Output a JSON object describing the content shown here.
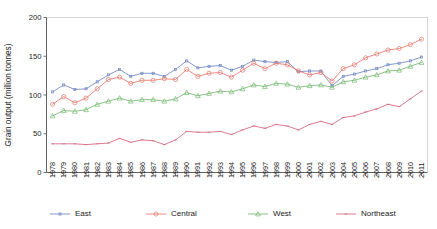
{
  "chart_data": {
    "type": "line",
    "title": "",
    "xlabel": "",
    "ylabel": "Grain output (million tonnes)",
    "ylim": [
      0,
      200
    ],
    "yticks": [
      0,
      50,
      100,
      150,
      200
    ],
    "grid": false,
    "legend_position": "bottom",
    "categories": [
      "1978",
      "1979",
      "1980",
      "1981",
      "1982",
      "1983",
      "1984",
      "1985",
      "1986",
      "1987",
      "1988",
      "1989",
      "1990",
      "1991",
      "1992",
      "1993",
      "1994",
      "1995",
      "1996",
      "1997",
      "1998",
      "1999",
      "2000",
      "2001",
      "2002",
      "2003",
      "2004",
      "2005",
      "2006",
      "2007",
      "2008",
      "2009",
      "2010",
      "2011"
    ],
    "series": [
      {
        "name": "East",
        "color": "#6f86c4",
        "marker": "dot",
        "values": [
          104,
          113,
          107,
          108,
          117,
          126,
          133,
          124,
          128,
          128,
          124,
          133,
          144,
          135,
          137,
          138,
          132,
          137,
          145,
          143,
          142,
          143,
          130,
          131,
          131,
          112,
          124,
          127,
          131,
          134,
          139,
          141,
          144,
          149
        ]
      },
      {
        "name": "Central",
        "color": "#e8756b",
        "marker": "circle",
        "values": [
          88,
          98,
          90,
          96,
          108,
          120,
          123,
          115,
          119,
          119,
          121,
          120,
          133,
          124,
          128,
          129,
          123,
          132,
          141,
          134,
          141,
          139,
          131,
          126,
          129,
          118,
          134,
          139,
          148,
          153,
          158,
          160,
          165,
          172
        ]
      },
      {
        "name": "West",
        "color": "#72b86f",
        "marker": "triangle",
        "values": [
          73,
          80,
          79,
          81,
          88,
          92,
          96,
          92,
          94,
          94,
          92,
          95,
          103,
          99,
          102,
          105,
          104,
          108,
          113,
          111,
          115,
          114,
          110,
          112,
          113,
          110,
          117,
          119,
          123,
          126,
          131,
          132,
          137,
          142
        ]
      },
      {
        "name": "Northeast",
        "color": "#d4647e",
        "marker": "dash",
        "values": [
          37,
          37,
          37,
          36,
          37,
          38,
          44,
          39,
          42,
          41,
          36,
          42,
          53,
          52,
          52,
          53,
          49,
          55,
          60,
          57,
          62,
          60,
          55,
          62,
          66,
          62,
          71,
          73,
          78,
          82,
          88,
          85,
          95,
          105
        ]
      }
    ]
  },
  "legend": {
    "items": [
      {
        "label": "East"
      },
      {
        "label": "Central"
      },
      {
        "label": "West"
      },
      {
        "label": "Northeast"
      }
    ]
  },
  "axes": {
    "y_title": "Grain output (million tonnes)",
    "y_ticks": [
      "0",
      "50",
      "100",
      "150",
      "200"
    ],
    "x_ticks": [
      "1978",
      "1979",
      "1980",
      "1981",
      "1982",
      "1983",
      "1984",
      "1985",
      "1986",
      "1987",
      "1988",
      "1989",
      "1990",
      "1991",
      "1992",
      "1993",
      "1994",
      "1995",
      "1996",
      "1997",
      "1998",
      "1999",
      "2000",
      "2001",
      "2002",
      "2003",
      "2004",
      "2005",
      "2006",
      "2007",
      "2008",
      "2009",
      "2010",
      "2011"
    ]
  }
}
